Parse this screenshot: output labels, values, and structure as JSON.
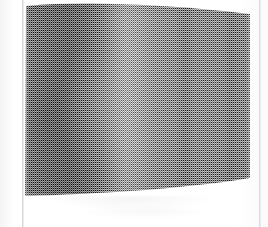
{
  "page": {
    "title": "Scanned halftone photograph",
    "background_color": "#ffffff",
    "width": 268,
    "height": 227
  },
  "margins": {
    "left_rule_label": "left margin rule",
    "right_rule_label": "right margin rule",
    "rule_color": "#d8d8d8"
  },
  "figure": {
    "caption": "",
    "alt": "Halftone-screened grayscale photograph of a curved draped surface with a dark vertical fold at left, a bright highlight ridge, and two faint vertical creases at right",
    "rendering": "ordered-dither halftone screen",
    "screen_cell_px": 2,
    "tone_min": "#5a5a5a",
    "tone_max": "#c6c6c6",
    "highlight_color": "#c6c6c6",
    "shadow_color": "#5a5a5a",
    "midtone_color": "#969696",
    "bounds": {
      "left": 24,
      "top": 0,
      "width": 228,
      "height": 198
    },
    "features": [
      {
        "name": "dark-fold-valley",
        "position_pct": 18,
        "tone": "#5a5a5a"
      },
      {
        "name": "highlight-ridge",
        "position_pct": 45,
        "tone": "#c6c6c6"
      },
      {
        "name": "crease-mid-right",
        "position_pct": 70,
        "tone": "#8a8a8a"
      },
      {
        "name": "crease-far-right",
        "position_pct": 90,
        "tone": "#8e8e8e"
      }
    ]
  },
  "artifacts": {
    "ghost_shadow_label": "faint scan shadow below figure",
    "ghost_opacity": 0.045
  }
}
